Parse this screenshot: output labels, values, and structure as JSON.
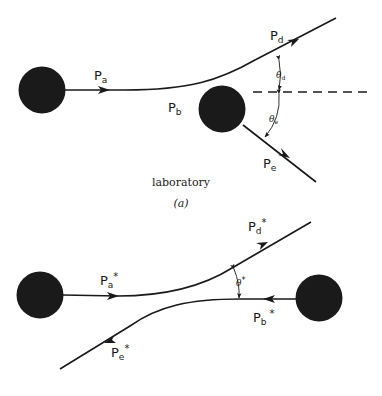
{
  "figure": {
    "panel_a": {
      "caption": "laboratory",
      "label": "(a)",
      "momenta": {
        "pa": {
          "base": "P",
          "sub": "a",
          "sup": ""
        },
        "pb": {
          "base": "P",
          "sub": "b",
          "sup": ""
        },
        "pd": {
          "base": "P",
          "sub": "d",
          "sup": ""
        },
        "pe": {
          "base": "P",
          "sub": "e",
          "sup": ""
        }
      },
      "angles": {
        "theta_d": {
          "base": "θ",
          "sub": "d"
        },
        "theta_e": {
          "base": "θ",
          "sub": "e"
        }
      }
    },
    "panel_b": {
      "momenta": {
        "pa": {
          "base": "P",
          "sub": "a",
          "sup": "*"
        },
        "pb": {
          "base": "P",
          "sub": "b",
          "sup": "*"
        },
        "pd": {
          "base": "P",
          "sub": "d",
          "sup": "*"
        },
        "pe": {
          "base": "P",
          "sub": "e",
          "sup": "*"
        }
      },
      "angles": {
        "theta_star": {
          "base": "θ",
          "sup": "*"
        }
      }
    },
    "colors": {
      "ink": "#1a1a1a",
      "background": "#ffffff"
    }
  }
}
